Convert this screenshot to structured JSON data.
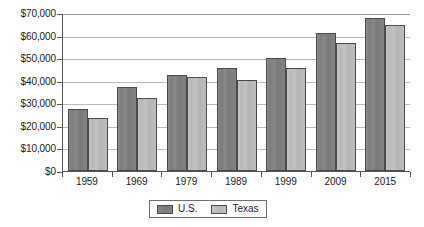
{
  "chart_data": {
    "type": "bar",
    "title": "",
    "subtitle": "",
    "xlabel": "",
    "ylabel": "",
    "categories": [
      "1959",
      "1969",
      "1979",
      "1989",
      "1999",
      "2009",
      "2015"
    ],
    "series": [
      {
        "name": "U.S.",
        "color": "#7c7c7c",
        "values": [
          27500,
          37000,
          42500,
          45500,
          50000,
          61000,
          68000
        ]
      },
      {
        "name": "Texas",
        "color": "#b8b8b8",
        "values": [
          23500,
          32500,
          41500,
          40500,
          45500,
          56500,
          64500
        ]
      }
    ],
    "ylim": [
      0,
      70000
    ],
    "ytick_values": [
      0,
      10000,
      20000,
      30000,
      40000,
      50000,
      60000,
      70000
    ],
    "ytick_labels": [
      "$0",
      "$10,000",
      "$20,000",
      "$30,000",
      "$40,000",
      "$50,000",
      "$60,000",
      "$70,000"
    ],
    "grid": "horizontal",
    "legend_position": "bottom-center",
    "legend_entries": [
      "U.S.",
      "Texas"
    ]
  }
}
